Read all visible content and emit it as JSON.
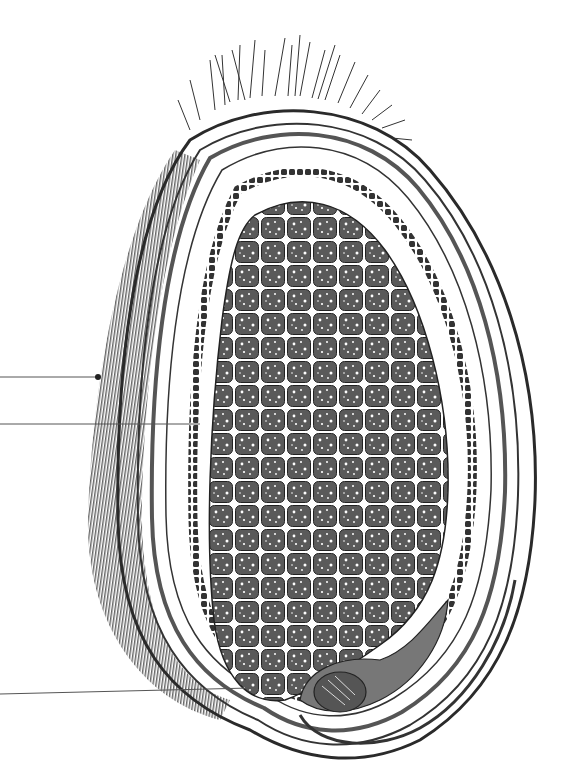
{
  "figure": {
    "background": "#ffffff",
    "ink": "#2a2a2a",
    "labels": [],
    "leader_lines": [
      {
        "id": "pericarp-pointer",
        "x1": 0,
        "y1": 377,
        "x2": 98,
        "y2": 377,
        "dot": true
      },
      {
        "id": "seed-coat-pointer",
        "x1": 0,
        "y1": 424,
        "x2": 200,
        "y2": 424,
        "dot": false
      },
      {
        "id": "embryo-pointer",
        "x1": 0,
        "y1": 694,
        "x2": 250,
        "y2": 688,
        "dot": false
      }
    ]
  }
}
